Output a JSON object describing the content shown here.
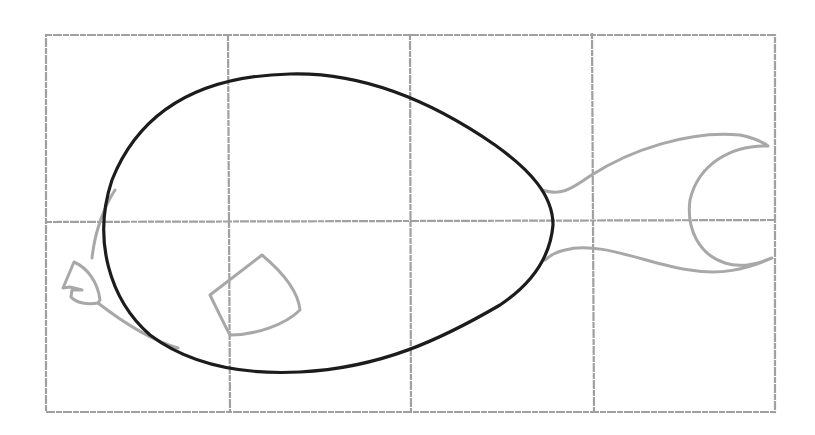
{
  "drawing": {
    "subject": "fish sketch on grid",
    "grid": {
      "columns": 4,
      "rows": 2,
      "line_color": "#a0a0a0"
    },
    "parts": [
      {
        "name": "body-outline",
        "color": "#1c1c1c"
      },
      {
        "name": "tail-fin",
        "color": "#a8a8a8"
      },
      {
        "name": "pectoral-fin",
        "color": "#a8a8a8"
      },
      {
        "name": "mouth",
        "color": "#a8a8a8"
      },
      {
        "name": "head-guide-line",
        "color": "#a8a8a8"
      }
    ]
  }
}
